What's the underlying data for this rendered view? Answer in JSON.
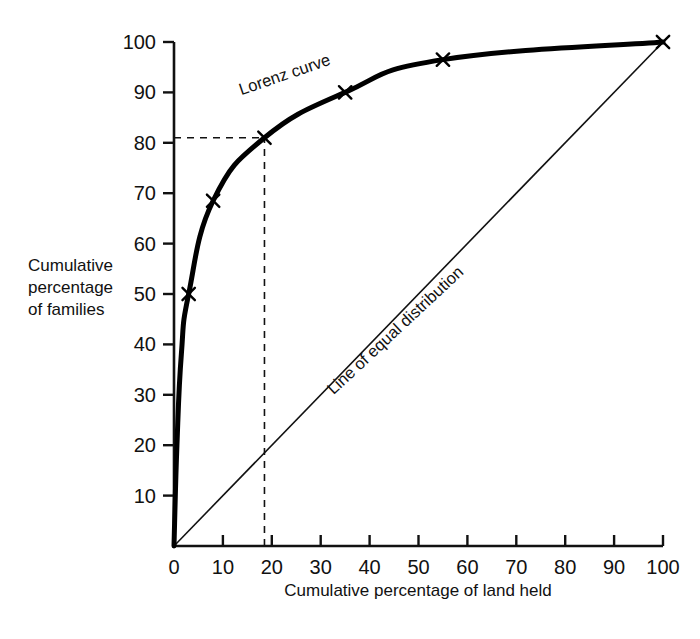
{
  "chart_data": {
    "type": "line",
    "title": "",
    "subtitle": "",
    "xlabel": "Cumulative percentage of land held",
    "ylabel": "Cumulative percentage of families",
    "ylabel_lines": [
      "Cumulative",
      "percentage",
      "of families"
    ],
    "xlim": [
      0,
      100
    ],
    "ylim": [
      0,
      100
    ],
    "grid": false,
    "legend_position": "inline-annotations",
    "xticks": [
      0,
      10,
      20,
      30,
      40,
      50,
      60,
      70,
      80,
      90,
      100
    ],
    "xtick_labels": [
      "0",
      "10",
      "20",
      "30",
      "40",
      "50",
      "60",
      "70",
      "80",
      "90",
      "100"
    ],
    "yticks": [
      10,
      20,
      30,
      40,
      50,
      60,
      70,
      80,
      90,
      100
    ],
    "ytick_labels": [
      "10",
      "20",
      "30",
      "40",
      "50",
      "60",
      "70",
      "80",
      "90",
      "100"
    ],
    "series": [
      {
        "name": "Lorenz curve",
        "marker": "x",
        "linewidth_px": 5,
        "x": [
          0,
          0.6,
          1.5,
          3.0,
          8.0,
          18.5,
          35.0,
          55.0,
          100.0
        ],
        "y": [
          0,
          20,
          38,
          50,
          68.5,
          81.0,
          90.0,
          96.5,
          100.0
        ],
        "marked_points": [
          {
            "x": 3.0,
            "y": 50.0
          },
          {
            "x": 8.0,
            "y": 68.5
          },
          {
            "x": 18.5,
            "y": 81.0
          },
          {
            "x": 35.0,
            "y": 90.0
          },
          {
            "x": 55.0,
            "y": 96.5
          },
          {
            "x": 100.0,
            "y": 100.0
          }
        ]
      },
      {
        "name": "Line of equal distribution",
        "marker": "none",
        "linewidth_px": 1.6,
        "x": [
          0,
          100
        ],
        "y": [
          0,
          100
        ]
      }
    ],
    "annotations": [
      {
        "name": "lorenz-curve-label",
        "text": "Lorenz curve",
        "x": 23.0,
        "y": 92.5,
        "rotation_deg": -19
      },
      {
        "name": "line-of-equal-distribution-label",
        "text": "Line of equal distribution",
        "x": 46.0,
        "y": 42.0,
        "rotation_deg": -43
      }
    ],
    "guides": [
      {
        "name": "guide-horizontal-80",
        "type": "dashed-horizontal",
        "y": 81.0,
        "from_x": 0,
        "to_x": 18.5
      },
      {
        "name": "guide-vertical-18",
        "type": "dashed-vertical",
        "x": 18.5,
        "from_y": 0,
        "to_y": 81.0
      }
    ],
    "colors": {
      "axis": "#111111",
      "curve": "#000000",
      "equality_line": "#111111",
      "guide": "#111111",
      "background": "#ffffff",
      "text": "#111111"
    }
  }
}
